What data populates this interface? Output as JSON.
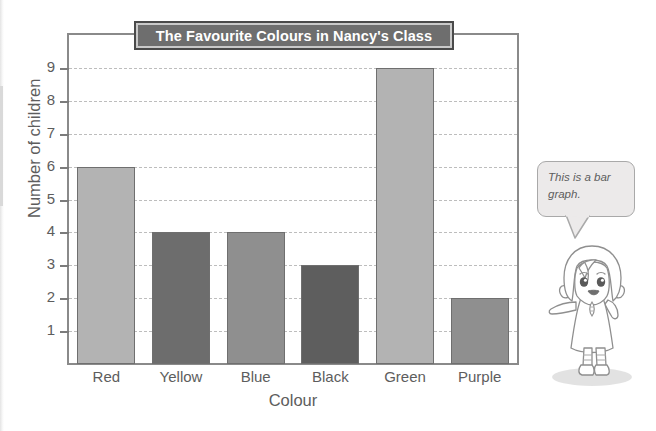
{
  "chart_data": {
    "type": "bar",
    "title": "The Favourite Colours in Nancy's Class",
    "xlabel": "Colour",
    "ylabel": "Number of children",
    "categories": [
      "Red",
      "Yellow",
      "Blue",
      "Black",
      "Green",
      "Purple"
    ],
    "values": [
      6,
      4,
      4,
      3,
      9,
      2
    ],
    "yticks": [
      1,
      2,
      3,
      4,
      5,
      6,
      7,
      8,
      9
    ],
    "ylim": [
      0,
      10
    ],
    "grid": true,
    "legend": false,
    "bar_colors": [
      "#b3b3b3",
      "#6d6d6d",
      "#8f8f8f",
      "#5e5e5e",
      "#b3b3b3",
      "#8f8f8f"
    ]
  },
  "annotation": {
    "bubble_line1": "This is a bar",
    "bubble_line2": "graph.",
    "character": "girl-character"
  },
  "colors": {
    "title_bar_fill": "#6e6e6e",
    "title_bar_border": "#4a4a4a",
    "title_text": "#ffffff",
    "axis": "#8a8a8a",
    "gridline": "#bdbdbd",
    "text": "#5d5d5d",
    "bubble_fill": "#eceaea",
    "bubble_border": "#a9a9a9"
  }
}
